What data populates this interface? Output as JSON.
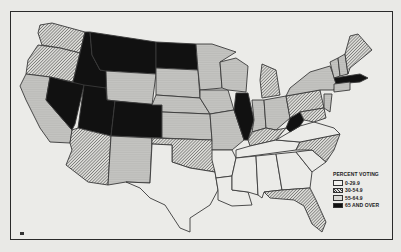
{
  "map": {
    "title": "Percent Voting by State",
    "legend": {
      "title": "PERCENT VOTING",
      "items": [
        {
          "label": "0-29.9",
          "pattern": "white"
        },
        {
          "label": "30-54.9",
          "pattern": "hatched"
        },
        {
          "label": "55-64.9",
          "pattern": "dotted"
        },
        {
          "label": "65 AND OVER",
          "pattern": "black"
        }
      ]
    },
    "categories": {
      "white": [
        "TX",
        "LA",
        "MS",
        "AL",
        "GA",
        "SC",
        "AR",
        "TN",
        "VA"
      ],
      "hatched": [
        "WA",
        "OR",
        "AZ",
        "OK",
        "FL",
        "NC",
        "KY",
        "MI",
        "PA",
        "ME",
        "MD"
      ],
      "dotted": [
        "CA",
        "NM",
        "WY",
        "SD",
        "NE",
        "KS",
        "MN",
        "IA",
        "MO",
        "WI",
        "IN",
        "OH",
        "NY",
        "VT",
        "NH",
        "CT",
        "NJ"
      ],
      "black": [
        "MT",
        "ND",
        "ID",
        "NV",
        "UT",
        "CO",
        "IL",
        "WV",
        "MA"
      ]
    },
    "page_marker": "■"
  }
}
